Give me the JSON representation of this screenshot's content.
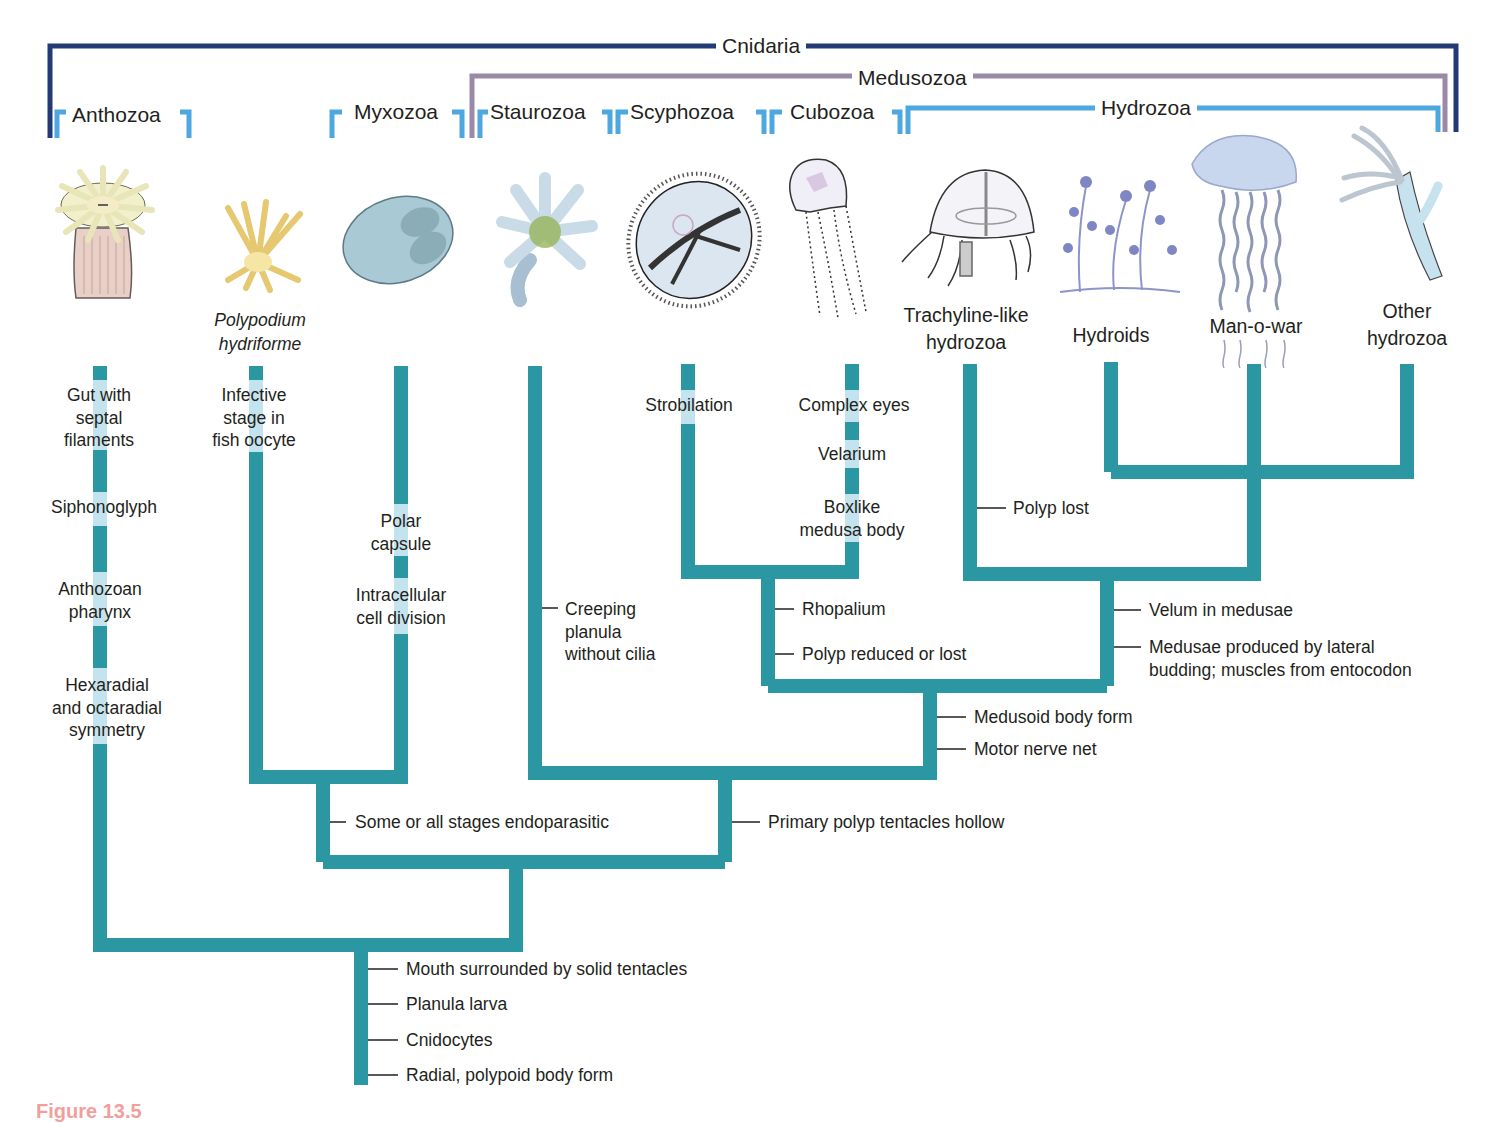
{
  "groups": {
    "cnidaria": "Cnidaria",
    "medusozoa": "Medusozoa",
    "hydrozoa": "Hydrozoa",
    "anthozoa": "Anthozoa",
    "myxozoa": "Myxozoa",
    "staurozoa": "Staurozoa",
    "scyphozoa": "Scyphozoa",
    "cubozoa": "Cubozoa"
  },
  "taxa": {
    "polypodium": "Polypodium\nhydriforme",
    "trachyline": "Trachyline-like\nhydrozoa",
    "hydroids": "Hydroids",
    "manowar": "Man-o-war",
    "other_hydrozoa": "Other\nhydrozoa"
  },
  "icons": [
    "sea-anemone-icon",
    "polypodium-icon",
    "myxozoan-spore-icon",
    "stauromedusa-icon",
    "scyphozoan-jellyfish-icon",
    "box-jellyfish-icon",
    "trachyline-medusa-icon",
    "hydroid-colony-icon",
    "portuguese-man-o-war-icon",
    "hydra-polyp-icon"
  ],
  "characters": {
    "anthozoa": [
      "Gut with\nseptal\nfilaments",
      "Siphonoglyph",
      "Anthozoan\npharynx",
      "Hexaradial\nand octaradial\nsymmetry"
    ],
    "polypodium": [
      "Infective\nstage in\nfish oocyte"
    ],
    "myxozoa": [
      "Polar\ncapsule",
      "Intracellular\ncell division"
    ],
    "staurozoa": "Creeping\nplanula\nwithout cilia",
    "scyphozoa": "Strobilation",
    "cubozoa": [
      "Complex eyes",
      "Velarium",
      "Boxlike\nmedusa body"
    ],
    "trachyline": "Polyp lost",
    "acraspeda": [
      "Rhopalium",
      "Polyp reduced or lost"
    ],
    "hydrozoa": [
      "Velum in medusae",
      "Medusae produced by lateral\nbudding; muscles from entocodon"
    ],
    "medusozoa_core": [
      "Medusoid body form",
      "Motor nerve net"
    ],
    "endocnidozoa": "Some or all stages endoparasitic",
    "medusozoa": "Primary polyp tentacles hollow",
    "cnidaria": [
      "Mouth surrounded by solid tentacles",
      "Planula larva",
      "Cnidocytes",
      "Radial, polypoid body form"
    ]
  },
  "colors": {
    "branch": "#2a97a3",
    "branch_light": "#c3e4ef",
    "cnidaria_bracket": "#233a77",
    "medusozoa_bracket": "#9a8aa8",
    "class_bracket": "#4da8e0"
  },
  "figure_caption": "Figure 13.5"
}
